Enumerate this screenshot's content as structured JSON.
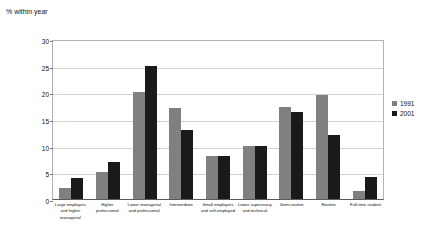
{
  "chart_data": {
    "type": "bar",
    "title": "",
    "ylabel": "% within year",
    "xlabel": "",
    "ylim": [
      0,
      30
    ],
    "yticks": [
      0,
      5,
      10,
      15,
      20,
      25,
      30
    ],
    "grid": true,
    "legend_position": "right",
    "categories": [
      "Large employers and higher managerial",
      "Higher professional",
      "Lower managerial and professional",
      "Intermediate",
      "Small employers and self-employed",
      "Lower supervisory and technical",
      "Semi-routine",
      "Routine",
      "Full-time student"
    ],
    "series": [
      {
        "name": "1991",
        "color": "#808080",
        "values": [
          2.0,
          5.0,
          20.0,
          17.0,
          8.0,
          10.0,
          17.3,
          19.5,
          1.5
        ]
      },
      {
        "name": "2001",
        "color": "#1a1a1a",
        "values": [
          4.0,
          7.0,
          25.0,
          13.0,
          8.0,
          10.0,
          16.3,
          12.0,
          4.2
        ]
      }
    ]
  }
}
